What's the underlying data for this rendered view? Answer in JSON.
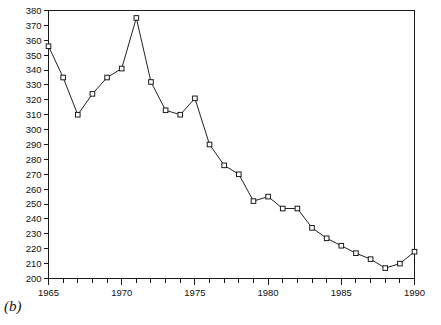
{
  "figure": {
    "panel_label": "(b)"
  },
  "chart_data": {
    "type": "line",
    "title": "",
    "xlabel": "",
    "ylabel": "",
    "xlim": [
      1965,
      1990
    ],
    "ylim": [
      200,
      380
    ],
    "grid": false,
    "legend": "none",
    "marker": "open-square",
    "x_tick_step": 1,
    "x_label_step": 5,
    "y_tick_step": 10,
    "x_tick_labels": [
      "1965",
      "1970",
      "1975",
      "1980",
      "1985",
      "1990"
    ],
    "y_tick_labels": [
      "200",
      "210",
      "220",
      "230",
      "240",
      "250",
      "260",
      "270",
      "280",
      "290",
      "300",
      "310",
      "320",
      "330",
      "340",
      "350",
      "360",
      "370",
      "380"
    ],
    "x": [
      1965,
      1966,
      1967,
      1968,
      1969,
      1970,
      1971,
      1972,
      1973,
      1974,
      1975,
      1976,
      1977,
      1978,
      1979,
      1980,
      1981,
      1982,
      1983,
      1984,
      1985,
      1986,
      1987,
      1988,
      1989,
      1990
    ],
    "values": [
      356,
      335,
      310,
      324,
      335,
      341,
      375,
      332,
      313,
      310,
      321,
      290,
      276,
      270,
      252,
      255,
      247,
      247,
      234,
      227,
      222,
      217,
      213,
      207,
      210,
      218
    ],
    "colors": {
      "line": "#222222",
      "marker_fill": "#ffffff",
      "marker_stroke": "#1a1a1a",
      "axis": "#1a1a1a",
      "background": "#ffffff"
    }
  }
}
